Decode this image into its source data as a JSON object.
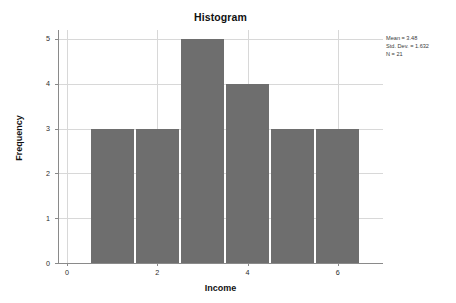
{
  "chart_data": {
    "type": "bar",
    "title": "Histogram",
    "xlabel": "Income",
    "ylabel": "Frequency",
    "categories": [
      "0.5-1.5",
      "1.5-2.5",
      "2.5-3.5",
      "3.5-4.5",
      "4.5-5.5",
      "5.5-6.5"
    ],
    "bin_edges": [
      0.5,
      1.5,
      2.5,
      3.5,
      4.5,
      5.5,
      6.5
    ],
    "values": [
      3,
      3,
      5,
      4,
      3,
      3
    ],
    "xlim": [
      -0.2,
      7.0
    ],
    "ylim": [
      0,
      5.2
    ],
    "xticks": [
      0,
      2,
      4,
      6
    ],
    "yticks": [
      0,
      1,
      2,
      3,
      4,
      5
    ],
    "grid": true,
    "legend": "none",
    "bar_color": "#6e6e6e",
    "annotations": {
      "mean": "Mean = 3.48",
      "std_dev": "Std. Dev. = 1.632",
      "n": "N = 21"
    }
  },
  "stats": {
    "mean_label": "Mean = 3.48",
    "stddev_label": "Std. Dev. = 1.632",
    "n_label": "N = 21"
  },
  "axes": {
    "title": "Histogram",
    "x_title": "Income",
    "y_title": "Frequency",
    "y_tick_labels": [
      "0",
      "1",
      "2",
      "3",
      "4",
      "5"
    ],
    "x_tick_labels": [
      "0",
      "2",
      "4",
      "6"
    ]
  }
}
